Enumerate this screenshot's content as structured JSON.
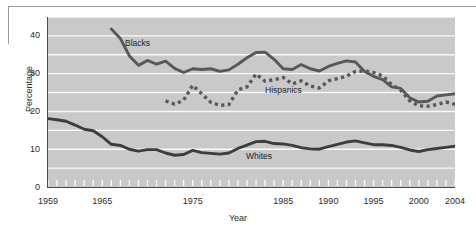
{
  "chart_data": {
    "type": "line",
    "title": "",
    "xlabel": "Year",
    "ylabel": "Percentage",
    "xlim": [
      1959,
      2004
    ],
    "ylim": [
      0,
      45
    ],
    "grid": true,
    "grid_interval": 5,
    "legend_position": "inline-labels",
    "y_ticks": [
      0,
      10,
      20,
      30,
      40
    ],
    "x_ticks": [
      1959,
      1965,
      1975,
      1985,
      1990,
      1995,
      2000,
      2004
    ],
    "x_minor_tick_interval": 1,
    "series": [
      {
        "name": "Blacks",
        "style": "solid",
        "color": "#585858",
        "x": [
          1966,
          1967,
          1968,
          1969,
          1970,
          1971,
          1972,
          1973,
          1974,
          1975,
          1976,
          1977,
          1978,
          1979,
          1980,
          1981,
          1982,
          1983,
          1984,
          1985,
          1986,
          1987,
          1988,
          1989,
          1990,
          1991,
          1992,
          1993,
          1994,
          1995,
          1996,
          1997,
          1998,
          1999,
          2000,
          2001,
          2002,
          2003,
          2004
        ],
        "values": [
          41.8,
          39.3,
          34.7,
          32.2,
          33.5,
          32.5,
          33.3,
          31.4,
          30.3,
          31.3,
          31.1,
          31.3,
          30.6,
          31.0,
          32.5,
          34.2,
          35.6,
          35.7,
          33.8,
          31.3,
          31.1,
          32.4,
          31.3,
          30.7,
          31.9,
          32.7,
          33.4,
          33.1,
          30.6,
          29.3,
          28.4,
          26.5,
          26.1,
          23.6,
          22.5,
          22.7,
          24.1,
          24.4,
          24.7
        ]
      },
      {
        "name": "Hispanics",
        "style": "dashed",
        "color": "#585858",
        "x": [
          1972,
          1973,
          1974,
          1975,
          1976,
          1977,
          1978,
          1979,
          1980,
          1981,
          1982,
          1983,
          1984,
          1985,
          1986,
          1987,
          1988,
          1989,
          1990,
          1991,
          1992,
          1993,
          1994,
          1995,
          1996,
          1997,
          1998,
          1999,
          2000,
          2001,
          2002,
          2003,
          2004
        ],
        "values": [
          22.8,
          21.9,
          23.0,
          26.9,
          24.7,
          22.4,
          21.6,
          21.8,
          25.7,
          26.5,
          29.9,
          28.0,
          28.4,
          29.0,
          27.3,
          28.1,
          26.7,
          26.2,
          28.1,
          28.7,
          29.3,
          30.6,
          30.7,
          30.3,
          29.4,
          27.1,
          25.6,
          22.8,
          21.5,
          21.4,
          21.8,
          22.5,
          21.9
        ]
      },
      {
        "name": "Whites",
        "style": "solid",
        "color": "#3d3d3d",
        "x": [
          1959,
          1960,
          1961,
          1962,
          1963,
          1964,
          1965,
          1966,
          1967,
          1968,
          1969,
          1970,
          1971,
          1972,
          1973,
          1974,
          1975,
          1976,
          1977,
          1978,
          1979,
          1980,
          1981,
          1982,
          1983,
          1984,
          1985,
          1986,
          1987,
          1988,
          1989,
          1990,
          1991,
          1992,
          1993,
          1994,
          1995,
          1996,
          1997,
          1998,
          1999,
          2000,
          2001,
          2002,
          2003,
          2004
        ],
        "values": [
          18.1,
          17.8,
          17.4,
          16.4,
          15.3,
          14.9,
          13.3,
          11.3,
          11.0,
          10.0,
          9.5,
          9.9,
          9.9,
          9.0,
          8.4,
          8.6,
          9.7,
          9.1,
          8.9,
          8.7,
          9.0,
          10.2,
          11.1,
          12.0,
          12.1,
          11.5,
          11.4,
          11.0,
          10.4,
          10.1,
          10.0,
          10.7,
          11.3,
          11.9,
          12.2,
          11.7,
          11.2,
          11.2,
          11.0,
          10.5,
          9.8,
          9.4,
          9.9,
          10.2,
          10.5,
          10.8
        ]
      }
    ]
  },
  "axis": {
    "y_title": "Percentage",
    "x_title": "Year",
    "y_tick_labels": [
      "40",
      "30",
      "20",
      "10",
      "0"
    ],
    "x_tick_labels": [
      "1959",
      "1965",
      "1975",
      "1985",
      "1990",
      "1995",
      "2000",
      "2004"
    ]
  },
  "series_labels": {
    "blacks": "Blacks",
    "hispanics": "Hispanics",
    "whites": "Whites"
  }
}
